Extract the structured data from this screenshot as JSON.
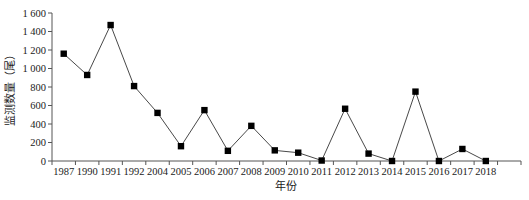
{
  "chart_data": {
    "type": "line",
    "title": "",
    "xlabel": "年份",
    "ylabel": "监测数量（尾）",
    "categories": [
      "1987",
      "1990",
      "1991",
      "1992",
      "2004",
      "2005",
      "2006",
      "2007",
      "2008",
      "2009",
      "2010",
      "2011",
      "2012",
      "2013",
      "2014",
      "2015",
      "2016",
      "2017",
      "2018"
    ],
    "series": [
      {
        "name": "监测数量",
        "values": [
          1160,
          930,
          1470,
          810,
          520,
          160,
          550,
          110,
          380,
          115,
          90,
          5,
          565,
          80,
          0,
          750,
          0,
          130,
          0
        ],
        "marker": "square",
        "color": "#000000"
      }
    ],
    "ylim": [
      0,
      1600
    ],
    "yticks": [
      0,
      200,
      400,
      600,
      800,
      1000,
      1200,
      1400,
      1600
    ],
    "ytick_labels": [
      "0",
      "200",
      "400",
      "600",
      "800",
      "1 000",
      "1 200",
      "1 400",
      "1 600"
    ],
    "grid": false,
    "legend": "none"
  }
}
